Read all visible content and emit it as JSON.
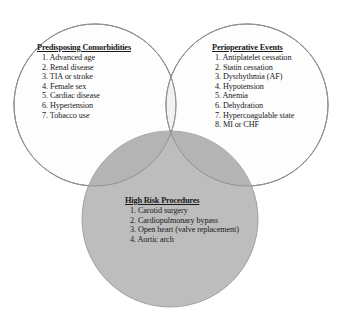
{
  "figure": {
    "type": "venn-diagram",
    "set_count": 3,
    "colors": {
      "circle_stroke": "#9a9a9a",
      "top_circle_fill": "#fdfdfd",
      "top_overlap_tint": "#f2f2f2",
      "bottom_circle_fill": "#bdbdbd",
      "text": "#1a1a1a",
      "background": "#ffffff"
    }
  },
  "groups": {
    "comorbidities": {
      "title": "Predisposing Comorbidities",
      "items": [
        "1. Advanced age",
        "2. Renal disease",
        "3. TIA or stroke",
        "4. Female sex",
        "5. Cardiac disease",
        "6. Hypertension",
        "7. Tobacco use"
      ]
    },
    "perioperative": {
      "title": "Perioperative Events",
      "items": [
        "1. Antiplatelet cessation",
        "2. Statin cessation",
        "3. Dysrhythmia (AF)",
        "4. Hypotension",
        "5. Anemia",
        "6. Dehydration",
        "7. Hypercoagulable state",
        "8. MI or CHF"
      ]
    },
    "procedures": {
      "title": "High Risk Procedures",
      "items": [
        "1. Carotid surgery",
        "2. Cardiopulmonary bypass",
        "3. Open heart (valve replacement)",
        "4. Aortic arch"
      ]
    }
  },
  "caption": {
    "text": ""
  }
}
